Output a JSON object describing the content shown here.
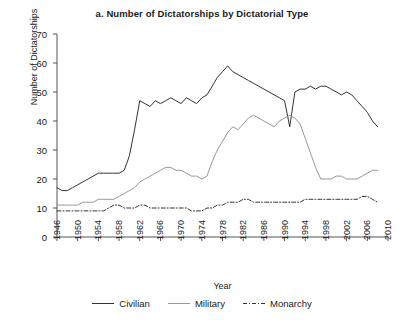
{
  "figure": {
    "title": "a. Number of Dictatorships by Dictatorial Type"
  },
  "axes": {
    "x_title": "Year",
    "y_title": "Number of Dictatorships",
    "y_ticks": [
      0,
      10,
      20,
      30,
      40,
      50,
      60,
      70
    ],
    "x_ticks": [
      1946,
      1950,
      1954,
      1958,
      1962,
      1966,
      1970,
      1974,
      1978,
      1982,
      1986,
      1990,
      1994,
      1998,
      2002,
      2006,
      2010
    ]
  },
  "legend": {
    "position": "bottom-center",
    "items": [
      {
        "label": "Civilian",
        "color": "#333333",
        "style": "solid"
      },
      {
        "label": "Military",
        "color": "#999999",
        "style": "solid"
      },
      {
        "label": "Monarchy",
        "color": "#333333",
        "style": "dashdot"
      }
    ]
  },
  "colors": {
    "civilian": "#333333",
    "military": "#999999",
    "monarchy": "#333333",
    "axis": "#555555",
    "background": "#ffffff"
  },
  "chart_data": {
    "type": "line",
    "title": "a. Number of Dictatorships by Dictatorial Type",
    "xlabel": "Year",
    "ylabel": "Number of Dictatorships",
    "xlim": [
      1946,
      2010
    ],
    "ylim": [
      0,
      70
    ],
    "grid": false,
    "legend_position": "bottom-center",
    "x": [
      1946,
      1947,
      1948,
      1949,
      1950,
      1951,
      1952,
      1953,
      1954,
      1955,
      1956,
      1957,
      1958,
      1959,
      1960,
      1961,
      1962,
      1963,
      1964,
      1965,
      1966,
      1967,
      1968,
      1969,
      1970,
      1971,
      1972,
      1973,
      1974,
      1975,
      1976,
      1977,
      1978,
      1979,
      1980,
      1981,
      1982,
      1983,
      1984,
      1985,
      1986,
      1987,
      1988,
      1989,
      1990,
      1991,
      1992,
      1993,
      1994,
      1995,
      1996,
      1997,
      1998,
      1999,
      2000,
      2001,
      2002,
      2003,
      2004,
      2005,
      2006,
      2007,
      2008
    ],
    "series": [
      {
        "name": "Civilian",
        "color": "#333333",
        "style": "solid",
        "values": [
          17,
          16,
          16,
          17,
          18,
          19,
          20,
          21,
          22,
          22,
          22,
          22,
          22,
          23,
          28,
          37,
          47,
          46,
          45,
          47,
          46,
          47,
          48,
          47,
          46,
          48,
          47,
          46,
          48,
          49,
          52,
          55,
          57,
          59,
          57,
          56,
          55,
          54,
          53,
          52,
          51,
          50,
          49,
          48,
          47,
          38,
          50,
          51,
          51,
          52,
          51,
          52,
          52,
          51,
          50,
          49,
          50,
          49,
          47,
          45,
          43,
          40,
          38
        ]
      },
      {
        "name": "Military",
        "color": "#999999",
        "style": "solid",
        "values": [
          11,
          11,
          11,
          11,
          11,
          12,
          12,
          12,
          13,
          13,
          13,
          13,
          14,
          15,
          16,
          17,
          19,
          20,
          21,
          22,
          23,
          24,
          24,
          23,
          23,
          22,
          21,
          21,
          20,
          21,
          26,
          30,
          33,
          36,
          38,
          37,
          39,
          41,
          42,
          41,
          40,
          39,
          38,
          40,
          41,
          42,
          41,
          39,
          34,
          29,
          24,
          20,
          20,
          20,
          21,
          21,
          20,
          20,
          20,
          21,
          22,
          23,
          23
        ]
      },
      {
        "name": "Monarchy",
        "color": "#333333",
        "style": "dashdot",
        "values": [
          9,
          9,
          9,
          9,
          9,
          9,
          9,
          9,
          9,
          9,
          10,
          11,
          11,
          10,
          10,
          10,
          11,
          11,
          10,
          10,
          10,
          10,
          10,
          10,
          10,
          10,
          9,
          9,
          9,
          10,
          10,
          11,
          11,
          12,
          12,
          12,
          13,
          13,
          12,
          12,
          12,
          12,
          12,
          12,
          12,
          12,
          12,
          12,
          13,
          13,
          13,
          13,
          13,
          13,
          13,
          13,
          13,
          13,
          13,
          14,
          14,
          13,
          12
        ]
      }
    ]
  }
}
